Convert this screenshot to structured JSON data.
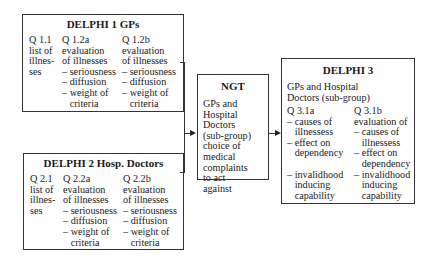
{
  "delphi1": {
    "title": "DELPHI 1 GPs",
    "columns": [
      {
        "id": "Q 1.1",
        "text": "Q 1.1\nlist of\nillnes-\nses"
      },
      {
        "id": "Q 1.2a",
        "text": "Q 1.2a\nevaluation\nof illnesses\n– seriousness\n– diffusion\n– weight of\n   criteria"
      },
      {
        "id": "Q 1.2b",
        "text": "Q 1.2b\nevaluation\nof illnesses\n– seriousness\n– diffusion\n– weight of\n   criteria"
      }
    ]
  },
  "delphi2": {
    "title": "DELPHI 2 Hosp. Doctors",
    "columns": [
      {
        "id": "Q 2.1",
        "text": "Q 2.1\nlist of\nillnes-\nses"
      },
      {
        "id": "Q 2.2a",
        "text": "Q 2.2a\nevaluation\nof illnesses\n– seriousness\n– diffusion\n– weight of\n   criteria"
      },
      {
        "id": "Q 2.2b",
        "text": "Q 2.2b\nevaluation\nof illnesses\n– seriousness\n– diffusion\n– weight of\n   criteria"
      }
    ]
  },
  "ngt": {
    "title": "NGT",
    "text": "GPs and\nHospital\nDoctors\n(sub-group)\nchoice of\nmedical\ncomplaints\nto act\nagainst"
  },
  "delphi3": {
    "title": "DELPHI 3",
    "subtitle": "GPs and Hospital\nDoctors (sub-group)",
    "columns": [
      {
        "id": "Q 3.1a",
        "text": "Q 3.1a\n– causes of\n   illnessess\n– effect on\n   dependency\n\n– invalidhood\n   inducing\n   capability"
      },
      {
        "id": "Q 3.1b",
        "text": "Q 3.1b\nevaluation of\n– causes of\n   illnessess\n– effect on\n   dependency\n– invalidhood\n   inducing\n   capability"
      }
    ]
  }
}
